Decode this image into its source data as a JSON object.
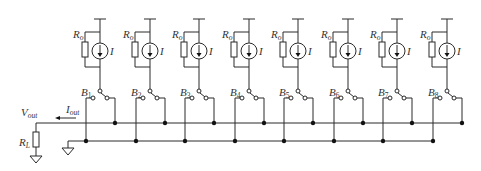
{
  "diagram": {
    "type": "circuit",
    "title": "",
    "units": [
      {
        "x": 100,
        "resistor_label": "R",
        "resistor_sub": "o",
        "source_label": "I",
        "switch_label": "B",
        "switch_sub": "1"
      },
      {
        "x": 150,
        "resistor_label": "R",
        "resistor_sub": "o",
        "source_label": "I",
        "switch_label": "B",
        "switch_sub": "2"
      },
      {
        "x": 199,
        "resistor_label": "R",
        "resistor_sub": "o",
        "source_label": "I",
        "switch_label": "B",
        "switch_sub": "3"
      },
      {
        "x": 249,
        "resistor_label": "R",
        "resistor_sub": "o",
        "source_label": "I",
        "switch_label": "B",
        "switch_sub": "4"
      },
      {
        "x": 298,
        "resistor_label": "R",
        "resistor_sub": "o",
        "source_label": "I",
        "switch_label": "B",
        "switch_sub": "5"
      },
      {
        "x": 348,
        "resistor_label": "R",
        "resistor_sub": "o",
        "source_label": "I",
        "switch_label": "B",
        "switch_sub": "6"
      },
      {
        "x": 397,
        "resistor_label": "R",
        "resistor_sub": "o",
        "source_label": "I",
        "switch_label": "B",
        "switch_sub": "7"
      },
      {
        "x": 447,
        "resistor_label": "R",
        "resistor_sub": "o",
        "source_label": "I",
        "switch_label": "B",
        "switch_sub": "8"
      }
    ],
    "output": {
      "voltage_label": "V",
      "voltage_sub": "out",
      "current_label": "I",
      "current_sub": "out",
      "load_label": "R",
      "load_sub": "L"
    },
    "colors": {
      "wire": "#2a2a2a",
      "text": "#333333",
      "background": "#ffffff"
    }
  }
}
